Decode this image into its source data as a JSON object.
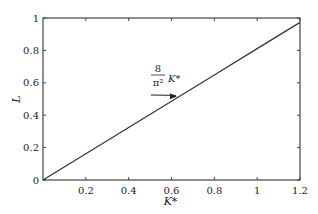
{
  "chart_data": {
    "type": "line",
    "title": "",
    "xlabel": "K*",
    "ylabel": "L",
    "xlim": [
      0,
      1.2
    ],
    "ylim": [
      0,
      1
    ],
    "grid": false,
    "legend": null,
    "xticks": [
      0.2,
      0.4,
      0.6,
      0.8,
      1,
      1.2
    ],
    "xtick_labels": [
      "0.2",
      "0.4",
      "0.6",
      "0.8",
      "1",
      "1.2"
    ],
    "yticks": [
      0,
      0.2,
      0.4,
      0.6,
      0.8,
      1
    ],
    "ytick_labels": [
      "0",
      "0.2",
      "0.4",
      "0.6",
      "0.8",
      "1"
    ],
    "series": [
      {
        "name": "8/π² K*",
        "x": [
          0,
          0.2,
          0.4,
          0.6,
          0.8,
          1.0,
          1.2
        ],
        "values": [
          0,
          0.162,
          0.324,
          0.486,
          0.648,
          0.811,
          0.973
        ],
        "color": "#333333"
      }
    ],
    "annotations": [
      {
        "text_numerator": "8",
        "text_denominator": "π²",
        "text_suffix": "K*",
        "arrow_to": [
          0.63,
          0.51
        ]
      }
    ]
  }
}
